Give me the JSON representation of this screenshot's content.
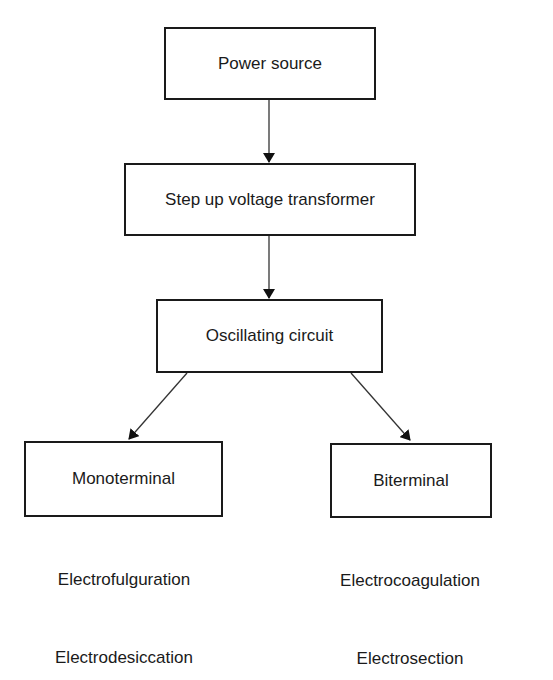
{
  "diagram": {
    "nodes": {
      "power_source": "Power source",
      "transformer": "Step up voltage transformer",
      "oscillator": "Oscillating circuit",
      "monoterminal": "Monoterminal",
      "biterminal": "Biterminal"
    },
    "monoterminal_uses": [
      "Electrofulguration",
      "Electrodesiccation"
    ],
    "biterminal_uses": [
      "Electrocoagulation",
      "Electrosection"
    ],
    "edges": [
      [
        "Power source",
        "Step up voltage transformer"
      ],
      [
        "Step up voltage transformer",
        "Oscillating circuit"
      ],
      [
        "Oscillating circuit",
        "Monoterminal"
      ],
      [
        "Oscillating circuit",
        "Biterminal"
      ]
    ]
  }
}
